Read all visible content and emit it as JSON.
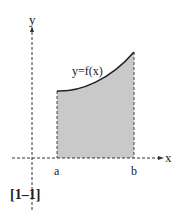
{
  "figure": {
    "x_axis_label": "x",
    "y_axis_label": "y",
    "curve_label": "y=f(x)",
    "a_label": "a",
    "b_label": "b",
    "caption": "[1–1]",
    "shade_color": "#c8c8c8",
    "line_color": "#222222"
  }
}
